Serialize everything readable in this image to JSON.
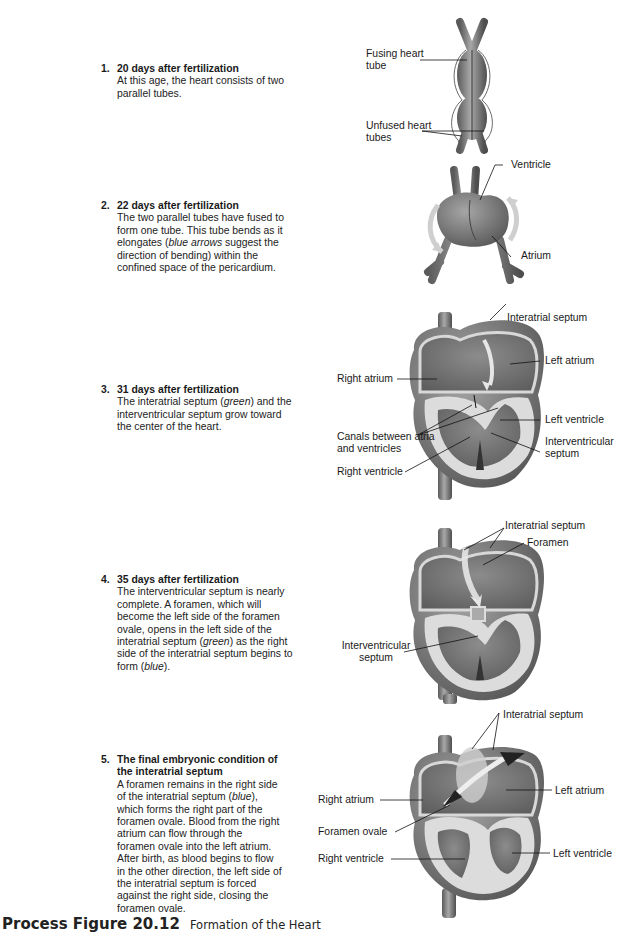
{
  "steps": [
    {
      "num": "1.",
      "title": "20 days after fertilization",
      "desc": "At this age, the heart consists of two parallel tubes."
    },
    {
      "num": "2.",
      "title": "22 days after fertilization",
      "desc_parts": [
        "The two parallel tubes have fused to form one tube. This tube bends as it elongates (",
        "blue arrows",
        " suggest the direction of bending) within the confined space of the pericardium."
      ]
    },
    {
      "num": "3.",
      "title": "31 days after fertilization",
      "desc_parts": [
        "The interatrial septum (",
        "green",
        ") and the interventricular septum grow toward the center of the heart."
      ]
    },
    {
      "num": "4.",
      "title": "35 days after fertilization",
      "desc_parts": [
        "The interventricular septum is nearly complete. A foramen, which will become the left side of the foramen ovale, opens in the left side of the interatrial septum (",
        "green",
        ") as the right side of the interatrial septum begins to form (",
        "blue",
        ")."
      ]
    },
    {
      "num": "5.",
      "title": "The final embryonic condition of the interatrial septum",
      "desc_parts": [
        "A foramen remains in the right side of the interatrial septum (",
        "blue",
        "), which forms the right part of the foramen ovale. Blood from the right atrium can flow through the foramen ovale into the left atrium.  After birth, as blood begins to flow in the other direction, the left side of the interatrial septum is forced against the right side, closing the foramen ovale."
      ]
    }
  ],
  "labels": {
    "fig1": {
      "fusing": "Fusing heart tube",
      "unfused": "Unfused heart tubes"
    },
    "fig2": {
      "ventricle": "Ventricle",
      "atrium": "Atrium"
    },
    "fig3": {
      "interatrial": "Interatrial septum",
      "left_atrium": "Left atrium",
      "right_atrium": "Right atrium",
      "left_ventricle": "Left ventricle",
      "canals": "Canals between atria and ventricles",
      "interventricular": "Interventricular septum",
      "right_ventricle": "Right ventricle"
    },
    "fig4": {
      "interatrial": "Interatrial septum",
      "foramen": "Foramen",
      "interventricular": "Interventricular septum"
    },
    "fig5": {
      "interatrial": "Interatrial septum",
      "right_atrium": "Right atrium",
      "left_atrium": "Left atrium",
      "foramen_ovale": "Foramen ovale",
      "right_ventricle": "Right ventricle",
      "left_ventricle": "Left ventricle"
    }
  },
  "caption": {
    "figure": "Process Figure 20.12",
    "title": "Formation of the Heart"
  }
}
